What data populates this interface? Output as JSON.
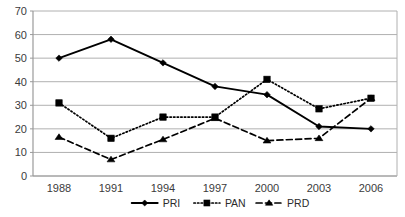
{
  "chart_data": {
    "type": "line",
    "title": "",
    "xlabel": "",
    "ylabel": "",
    "categories": [
      "1988",
      "1991",
      "1994",
      "1997",
      "2000",
      "2003",
      "2006"
    ],
    "ylim": [
      0,
      70
    ],
    "ytick_step": 10,
    "yticks": [
      "0",
      "10",
      "20",
      "30",
      "40",
      "50",
      "60",
      "70"
    ],
    "grid": "horizontal",
    "legend_position": "bottom-center",
    "series": [
      {
        "name": "PRI",
        "marker": "diamond",
        "line_style": "solid",
        "color": "#000000",
        "values": [
          50,
          58,
          48,
          38,
          34.5,
          21,
          20
        ]
      },
      {
        "name": "PAN",
        "marker": "square",
        "line_style": "dotted",
        "color": "#000000",
        "values": [
          31,
          16,
          25,
          25,
          41,
          28.5,
          33
        ]
      },
      {
        "name": "PRD",
        "marker": "triangle",
        "line_style": "dashed",
        "color": "#000000",
        "values": [
          16.5,
          7,
          15.5,
          24.5,
          15,
          16,
          33
        ]
      }
    ]
  },
  "legend": {
    "items": [
      {
        "label": "PRI"
      },
      {
        "label": "PAN"
      },
      {
        "label": "PRD"
      }
    ]
  },
  "colors": {
    "gridline": "#b0b0b0",
    "axis": "#9a9a9a",
    "series": "#000000",
    "tick_text": "#3b3b3b",
    "background": "#ffffff"
  }
}
